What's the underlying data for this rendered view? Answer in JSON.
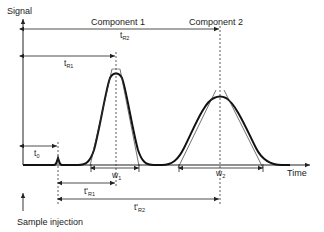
{
  "diagram": {
    "type": "chromatogram",
    "axes": {
      "y_label": "Signal",
      "x_label": "Time"
    },
    "components": [
      {
        "label": "Component 1",
        "retention_label": "t",
        "retention_sub": "R1",
        "width_label": "w",
        "width_sub": "1",
        "adjusted_label": "t'",
        "adjusted_sub": "R1"
      },
      {
        "label": "Component 2",
        "retention_label": "t",
        "retention_sub": "R2",
        "width_label": "w",
        "width_sub": "2",
        "adjusted_label": "t'",
        "adjusted_sub": "R2"
      }
    ],
    "dead_time": {
      "label": "t",
      "sub": "0"
    },
    "injection_label": "Sample injection",
    "colors": {
      "curve": "#111111",
      "lines": "#222222",
      "background": "#ffffff"
    }
  }
}
